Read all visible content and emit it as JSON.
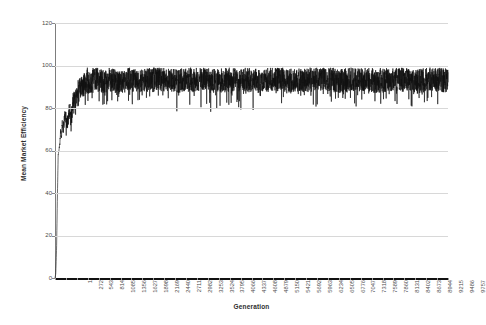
{
  "chart_data": {
    "type": "line",
    "title": "",
    "xlabel": "Generation",
    "ylabel": "Mean Market Efficiency",
    "xlim": [
      1,
      9757
    ],
    "ylim": [
      0,
      120
    ],
    "grid": true,
    "legend": "none",
    "series_name": "Mean Market Efficiency",
    "line_color": "#111111",
    "grid_color": "#d8d8d8",
    "background_color": "#ffffff",
    "ytick_labels": [
      "0",
      "20",
      "40",
      "60",
      "80",
      "100",
      "120"
    ],
    "ytick_values": [
      0,
      20,
      40,
      60,
      80,
      100,
      120
    ],
    "xtick_labels": [
      "1",
      "272",
      "543",
      "814",
      "1085",
      "1356",
      "1627",
      "1898",
      "2169",
      "2440",
      "2711",
      "2982",
      "3253",
      "3524",
      "3795",
      "4066",
      "4337",
      "4608",
      "4879",
      "5150",
      "5421",
      "5692",
      "5963",
      "6234",
      "6505",
      "6776",
      "7047",
      "7318",
      "7589",
      "7860",
      "8131",
      "8402",
      "8673",
      "8944",
      "9215",
      "9486",
      "9757"
    ],
    "xtick_values": [
      1,
      272,
      543,
      814,
      1085,
      1356,
      1627,
      1898,
      2169,
      2440,
      2711,
      2982,
      3253,
      3524,
      3795,
      4066,
      4337,
      4608,
      4879,
      5150,
      5421,
      5692,
      5963,
      6234,
      6505,
      6776,
      7047,
      7318,
      7589,
      7860,
      8131,
      8402,
      8673,
      8944,
      9215,
      9486,
      9757
    ],
    "x": [
      1,
      20,
      40,
      60,
      80,
      100,
      120,
      140,
      160,
      180,
      200,
      250,
      300,
      350,
      400,
      450,
      500,
      600,
      700,
      800,
      900,
      1000,
      1200,
      1400,
      1600,
      1800,
      2000,
      2500,
      3000,
      3500,
      4000,
      4500,
      5000,
      5500,
      6000,
      6500,
      7000,
      7500,
      8000,
      8500,
      9000,
      9400,
      9757
    ],
    "y": [
      0,
      2,
      14,
      38,
      58,
      60,
      63,
      70,
      66,
      74,
      69,
      78,
      72,
      80,
      76,
      83,
      86,
      90,
      92,
      94,
      93,
      95,
      94,
      95,
      93,
      95,
      94,
      95,
      94,
      95,
      94,
      95,
      94,
      95,
      94,
      95,
      94,
      95,
      94,
      95,
      94,
      95,
      94
    ],
    "band_min": 85,
    "band_max": 99,
    "noise_amplitude": 6
  }
}
